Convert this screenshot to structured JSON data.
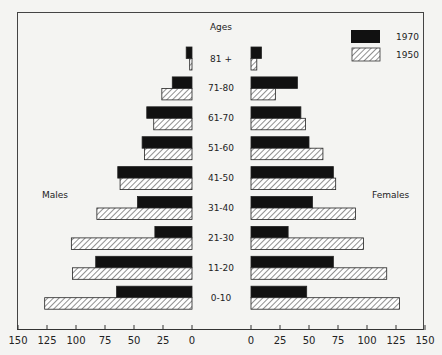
{
  "chart_data": {
    "type": "bar",
    "subtype": "population-pyramid",
    "title": "",
    "center_label": "Ages",
    "categories": [
      "81 +",
      "71-80",
      "61-70",
      "51-60",
      "41-50",
      "31-40",
      "21-30",
      "11-20",
      "0-10"
    ],
    "left_side_label": "Males",
    "right_side_label": "Females",
    "series": [
      {
        "name": "1970",
        "style": "solid",
        "color": "#111111",
        "males": [
          5,
          17,
          39,
          43,
          64,
          47,
          32,
          83,
          65
        ],
        "females": [
          9,
          40,
          43,
          50,
          71,
          53,
          32,
          71,
          48
        ]
      },
      {
        "name": "1950",
        "style": "hatched",
        "color": "#ffffff",
        "males": [
          2,
          26,
          33,
          41,
          62,
          82,
          104,
          103,
          127
        ],
        "females": [
          5,
          21,
          47,
          62,
          73,
          90,
          97,
          117,
          128
        ]
      }
    ],
    "x_ticks_left": [
      "150",
      "125",
      "100",
      "75",
      "50",
      "25",
      "0"
    ],
    "x_ticks_right": [
      "0",
      "25",
      "50",
      "75",
      "100",
      "125",
      "150"
    ],
    "xlim": [
      0,
      150
    ],
    "grid": false,
    "legend_position": "top-right"
  },
  "legend": [
    {
      "label": "1970",
      "style": "solid"
    },
    {
      "label": "1950",
      "style": "hatched"
    }
  ]
}
